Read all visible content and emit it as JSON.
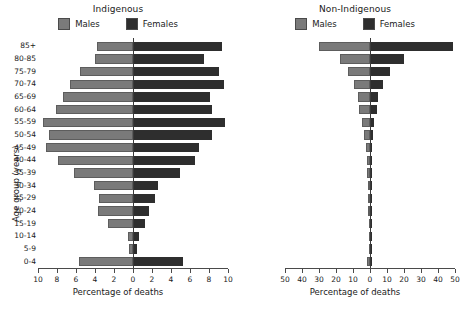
{
  "figure": {
    "legend": {
      "males_label": "Males",
      "females_label": "Females",
      "male_color": "#7a7a7a",
      "female_color": "#2e2e2e"
    },
    "axis_titles": {
      "x": "Percentage of deaths",
      "y": "Age group (years)"
    }
  },
  "chart_data": [
    {
      "type": "bar",
      "subtype": "population-pyramid",
      "title": "Indigenous",
      "xlabel": "Percentage of deaths",
      "ylabel": "Age group (years)",
      "xlim": [
        -10,
        10
      ],
      "xticks": [
        10,
        8,
        6,
        4,
        2,
        0,
        2,
        4,
        6,
        8,
        10
      ],
      "xtick_values": [
        -10,
        -8,
        -6,
        -4,
        -2,
        0,
        2,
        4,
        6,
        8,
        10
      ],
      "grid": false,
      "legend_position": "top-center",
      "categories": [
        "85+",
        "80-85",
        "75-79",
        "70-74",
        "65-69",
        "60-64",
        "55-59",
        "50-54",
        "45-49",
        "40-44",
        "35-39",
        "30-34",
        "25-29",
        "20-24",
        "15-19",
        "10-14",
        "5-9",
        "0-4"
      ],
      "series": [
        {
          "name": "Males",
          "values": [
            3.8,
            4.0,
            5.6,
            6.6,
            7.4,
            8.1,
            9.5,
            8.8,
            9.2,
            7.9,
            6.2,
            4.1,
            3.6,
            3.7,
            2.6,
            0.5,
            0.4,
            5.7
          ]
        },
        {
          "name": "Females",
          "values": [
            9.4,
            7.5,
            9.0,
            9.6,
            8.1,
            8.3,
            9.7,
            8.3,
            6.9,
            6.5,
            4.9,
            2.6,
            2.3,
            1.7,
            1.3,
            0.6,
            0.4,
            5.3
          ]
        }
      ]
    },
    {
      "type": "bar",
      "subtype": "population-pyramid",
      "title": "Non-Indigenous",
      "xlabel": "Percentage of deaths",
      "ylabel": "Age group (years)",
      "xlim": [
        -50,
        50
      ],
      "xticks": [
        50,
        40,
        30,
        20,
        10,
        0,
        10,
        20,
        30,
        40,
        50
      ],
      "xtick_values": [
        -50,
        -40,
        -30,
        -20,
        -10,
        0,
        10,
        20,
        30,
        40,
        50
      ],
      "grid": false,
      "legend_position": "top-center",
      "categories": [
        "85+",
        "80-85",
        "75-79",
        "70-74",
        "65-69",
        "60-64",
        "55-59",
        "50-54",
        "45-49",
        "40-44",
        "35-39",
        "30-34",
        "25-29",
        "20-24",
        "15-19",
        "10-14",
        "5-9",
        "0-4"
      ],
      "series": [
        {
          "name": "Males",
          "values": [
            30.0,
            17.5,
            13.0,
            9.5,
            7.0,
            6.5,
            4.5,
            3.5,
            2.2,
            1.7,
            1.5,
            1.3,
            1.3,
            1.2,
            0.7,
            0.3,
            0.3,
            1.5
          ]
        },
        {
          "name": "Females",
          "values": [
            49.0,
            20.0,
            12.0,
            7.5,
            4.5,
            4.0,
            2.5,
            2.0,
            1.3,
            1.2,
            1.0,
            0.8,
            0.8,
            0.6,
            0.4,
            0.2,
            0.2,
            1.2
          ]
        }
      ]
    }
  ]
}
